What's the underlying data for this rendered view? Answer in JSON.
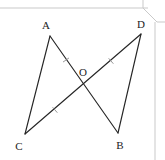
{
  "figure": {
    "type": "geometry-diagram",
    "background_color": "#ffffff",
    "stroke_color": "#262626",
    "frame_color": "#c9c9c9",
    "points": {
      "A": {
        "label": "A",
        "x": 50,
        "y": 36,
        "label_x": 46,
        "label_y": 25
      },
      "B": {
        "label": "B",
        "x": 118,
        "y": 133,
        "label_x": 120,
        "label_y": 145
      },
      "C": {
        "label": "C",
        "x": 25,
        "y": 134,
        "label_x": 19,
        "label_y": 146
      },
      "D": {
        "label": "D",
        "x": 141,
        "y": 34,
        "label_x": 141,
        "label_y": 24
      },
      "O": {
        "label": "O",
        "x": 83,
        "y": 84,
        "label_x": 83,
        "label_y": 72
      }
    },
    "segments": [
      {
        "name": "segment-AC",
        "from": "A",
        "to": "C"
      },
      {
        "name": "segment-AB",
        "from": "A",
        "to": "B"
      },
      {
        "name": "segment-CD",
        "from": "C",
        "to": "D"
      },
      {
        "name": "segment-DB",
        "from": "D",
        "to": "B"
      }
    ],
    "tick_marks": [
      {
        "name": "tick-AO",
        "on": "segment-AO",
        "x": 66,
        "y": 60,
        "count": 1
      },
      {
        "name": "tick-OD",
        "on": "segment-OD",
        "x": 111,
        "y": 61,
        "count": 1
      },
      {
        "name": "tick-CO",
        "on": "segment-CO",
        "x": 55,
        "y": 110,
        "count": 1
      }
    ]
  },
  "page": {
    "top_rule_y": 8,
    "right_rule_x": 155,
    "dogear": {
      "name": "page-corner-fold",
      "x": 143,
      "y": 0,
      "size": 14
    }
  }
}
